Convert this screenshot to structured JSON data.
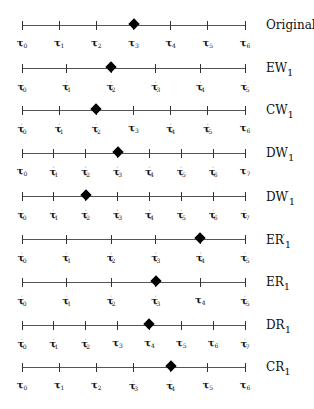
{
  "diagram": {
    "axis": {
      "x_start": 22,
      "x_end": 245
    },
    "rows": [
      {
        "name": "Original",
        "name_base": "Original",
        "name_sub": "",
        "name_prime": false,
        "y": 25,
        "ticks": [
          {
            "base": "τ",
            "sub": "0",
            "prime": false
          },
          {
            "base": "τ",
            "sub": "1",
            "prime": false
          },
          {
            "base": "τ",
            "sub": "2",
            "prime": false
          },
          {
            "base": "τ",
            "sub": "3",
            "prime": false
          },
          {
            "base": "τ",
            "sub": "4",
            "prime": false
          },
          {
            "base": "τ",
            "sub": "5",
            "prime": false
          },
          {
            "base": "τ",
            "sub": "6",
            "prime": false
          }
        ],
        "marker_index": 3
      },
      {
        "name": "EW1",
        "name_base": "EW",
        "name_sub": "1",
        "name_prime": false,
        "y": 68,
        "ticks": [
          {
            "base": "τ",
            "sub": "0",
            "prime": true
          },
          {
            "base": "τ",
            "sub": "1",
            "prime": true
          },
          {
            "base": "τ",
            "sub": "2",
            "prime": true
          },
          {
            "base": "τ",
            "sub": "3",
            "prime": true
          },
          {
            "base": "τ",
            "sub": "4",
            "prime": true
          },
          {
            "base": "τ",
            "sub": "5",
            "prime": true
          }
        ],
        "marker_index": 2
      },
      {
        "name": "CW1",
        "name_base": "CW",
        "name_sub": "1",
        "name_prime": false,
        "y": 110,
        "ticks": [
          {
            "base": "τ",
            "sub": "0",
            "prime": true
          },
          {
            "base": "τ",
            "sub": "1",
            "prime": true
          },
          {
            "base": "τ",
            "sub": "2",
            "prime": true
          },
          {
            "base": "τ",
            "sub": "3",
            "prime": false
          },
          {
            "base": "τ",
            "sub": "4",
            "prime": true
          },
          {
            "base": "τ",
            "sub": "5",
            "prime": true
          },
          {
            "base": "τ",
            "sub": "6",
            "prime": false
          }
        ],
        "marker_index": 2
      },
      {
        "name": "DW1",
        "name_base": "DW",
        "name_sub": "1",
        "name_prime": false,
        "y": 153,
        "ticks": [
          {
            "base": "τ",
            "sub": "0",
            "prime": false
          },
          {
            "base": "τ",
            "sub": "1",
            "prime": true
          },
          {
            "base": "τ",
            "sub": "2",
            "prime": true
          },
          {
            "base": "τ",
            "sub": "3",
            "prime": true
          },
          {
            "base": "τ",
            "sub": "4",
            "prime": true
          },
          {
            "base": "τ",
            "sub": "5",
            "prime": true
          },
          {
            "base": "τ",
            "sub": "6",
            "prime": true
          },
          {
            "base": "τ",
            "sub": "7",
            "prime": false
          }
        ],
        "marker_index": 3
      },
      {
        "name": "DW'1",
        "name_base": "DW",
        "name_sub": "1",
        "name_prime": true,
        "y": 196,
        "ticks": [
          {
            "base": "τ",
            "sub": "0",
            "prime": true
          },
          {
            "base": "τ",
            "sub": "1",
            "prime": true
          },
          {
            "base": "τ",
            "sub": "2",
            "prime": true
          },
          {
            "base": "τ",
            "sub": "3",
            "prime": true
          },
          {
            "base": "τ",
            "sub": "4",
            "prime": true
          },
          {
            "base": "τ",
            "sub": "5",
            "prime": true
          },
          {
            "base": "τ",
            "sub": "6",
            "prime": true
          },
          {
            "base": "τ",
            "sub": "7",
            "prime": true
          }
        ],
        "marker_index": 2
      },
      {
        "name": "ER'1",
        "name_base": "ER",
        "name_sub": "1",
        "name_prime": true,
        "y": 239,
        "ticks": [
          {
            "base": "τ",
            "sub": "0",
            "prime": true
          },
          {
            "base": "τ",
            "sub": "1",
            "prime": true
          },
          {
            "base": "τ",
            "sub": "2",
            "prime": true
          },
          {
            "base": "τ",
            "sub": "3",
            "prime": true
          },
          {
            "base": "τ",
            "sub": "4",
            "prime": true
          },
          {
            "base": "τ",
            "sub": "5",
            "prime": true
          }
        ],
        "marker_index": 4
      },
      {
        "name": "ER1",
        "name_base": "ER",
        "name_sub": "1",
        "name_prime": false,
        "y": 282,
        "ticks": [
          {
            "base": "τ",
            "sub": "0",
            "prime": true
          },
          {
            "base": "τ",
            "sub": "1",
            "prime": true
          },
          {
            "base": "τ",
            "sub": "2",
            "prime": true
          },
          {
            "base": "τ",
            "sub": "3",
            "prime": true
          },
          {
            "base": "τ",
            "sub": "4",
            "prime": false
          },
          {
            "base": "τ",
            "sub": "5",
            "prime": true
          }
        ],
        "marker_index": 3
      },
      {
        "name": "DR1",
        "name_base": "DR",
        "name_sub": "1",
        "name_prime": false,
        "y": 325,
        "ticks": [
          {
            "base": "τ",
            "sub": "0",
            "prime": true
          },
          {
            "base": "τ",
            "sub": "1",
            "prime": true
          },
          {
            "base": "τ",
            "sub": "2",
            "prime": true
          },
          {
            "base": "τ",
            "sub": "3",
            "prime": false
          },
          {
            "base": "τ",
            "sub": "4",
            "prime": false
          },
          {
            "base": "τ",
            "sub": "5",
            "prime": false
          },
          {
            "base": "τ",
            "sub": "6",
            "prime": false
          },
          {
            "base": "τ",
            "sub": "7",
            "prime": true
          }
        ],
        "marker_index": 4
      },
      {
        "name": "CR1",
        "name_base": "CR",
        "name_sub": "1",
        "name_prime": false,
        "y": 367,
        "ticks": [
          {
            "base": "τ",
            "sub": "0",
            "prime": false
          },
          {
            "base": "τ",
            "sub": "1",
            "prime": false
          },
          {
            "base": "τ",
            "sub": "2",
            "prime": false
          },
          {
            "base": "τ",
            "sub": "3",
            "prime": true
          },
          {
            "base": "τ",
            "sub": "4",
            "prime": true
          },
          {
            "base": "τ",
            "sub": "5",
            "prime": false
          },
          {
            "base": "τ",
            "sub": "6",
            "prime": false
          }
        ],
        "marker_index": 4
      }
    ]
  }
}
